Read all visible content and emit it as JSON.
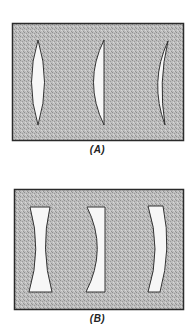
{
  "figure": {
    "panels": [
      {
        "id": "A",
        "caption": "(A)",
        "type": "converging lenses",
        "lenses": [
          {
            "kind": "biconvex"
          },
          {
            "kind": "plano-convex"
          },
          {
            "kind": "convex meniscus"
          }
        ]
      },
      {
        "id": "B",
        "caption": "(B)",
        "type": "diverging lenses",
        "lenses": [
          {
            "kind": "biconcave"
          },
          {
            "kind": "plano-concave"
          },
          {
            "kind": "concave meniscus"
          }
        ]
      }
    ],
    "colors": {
      "background": "#ffffff",
      "panel_fill": "#b4b4b4",
      "panel_border": "#2a2a2a",
      "lens_fill": "#f7f7f7",
      "lens_outline": "#333333"
    }
  }
}
